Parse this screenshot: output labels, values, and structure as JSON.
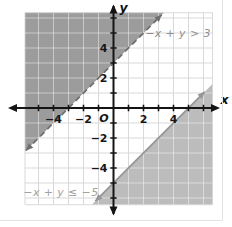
{
  "window": {
    "background": "#ffffff",
    "frame_border_color": "#e2e2e2"
  },
  "chart_data": {
    "type": "linear_inequality_system",
    "title": "",
    "xlabel": "x",
    "ylabel": "y",
    "origin_label": "O",
    "xlim": [
      -5.9,
      6.6
    ],
    "ylim": [
      -6.45,
      6.35
    ],
    "grid": true,
    "tick_step": 1,
    "x_ticks": [
      {
        "v": -4,
        "label": "−4"
      },
      {
        "v": -2,
        "label": "−2"
      },
      {
        "v": 2,
        "label": "2"
      },
      {
        "v": 4,
        "label": "4"
      }
    ],
    "y_ticks": [
      {
        "v": -4,
        "label": "−4"
      },
      {
        "v": -2,
        "label": "−2"
      },
      {
        "v": 2,
        "label": "2"
      },
      {
        "v": 4,
        "label": "4"
      }
    ],
    "colors": {
      "grid": "#d9d9d9",
      "grid_over_shade": "rgba(255,255,255,0.45)",
      "axis": "#141414",
      "background": "#ffffff"
    },
    "inequalities": [
      {
        "label": "−x + y > 3",
        "operator": ">",
        "slope": 1,
        "intercept": 3,
        "line_style": "dashed",
        "shade": "above",
        "fill": "#9c9c9c",
        "line_color": "#6f6f6f",
        "label_color": "#8d8d8d",
        "label_anchor": {
          "x": 4.3,
          "y": 4.75
        },
        "x_intercept": -3,
        "y_intercept": 3
      },
      {
        "label": "−x + y ≤ −5",
        "operator": "≤",
        "slope": 1,
        "intercept": -5,
        "line_style": "solid",
        "shade": "below",
        "fill": "#bcbcbc",
        "line_color": "#969696",
        "label_color": "#a2a2a2",
        "label_anchor": {
          "x": -3.5,
          "y": -5.85
        },
        "x_intercept": 5,
        "y_intercept": -5
      }
    ]
  }
}
